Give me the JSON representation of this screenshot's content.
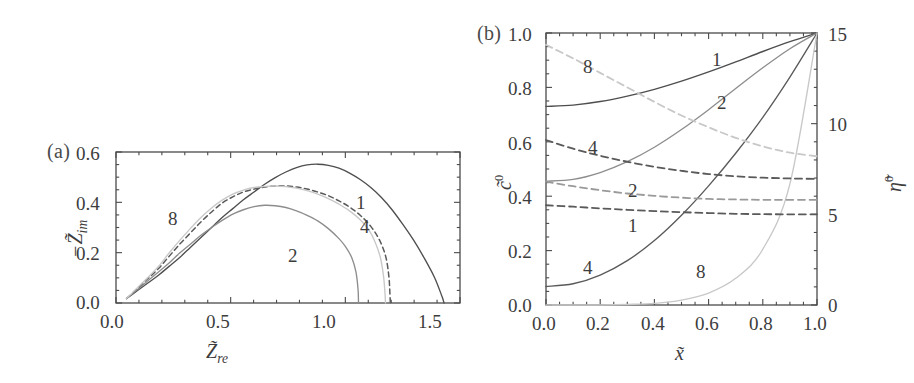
{
  "figure": {
    "background": "#ffffff",
    "panels": [
      "a",
      "b"
    ]
  },
  "panel_a": {
    "tag": "(a)",
    "xlabel": "Z̃",
    "xlabel_sub": "re",
    "ylabel_prefix": "−Z̃",
    "ylabel_sub": "im",
    "xticks": [
      "0.0",
      "0.5",
      "1.0",
      "1.5"
    ],
    "yticks": [
      "0.0",
      "0.2",
      "0.4",
      "0.6"
    ],
    "curve_labels": [
      "1",
      "2",
      "4",
      "8"
    ]
  },
  "panel_b": {
    "tag": "(b)",
    "xlabel": "x̃",
    "ylabel_left": "c̃",
    "ylabel_left_sup": "0",
    "ylabel_right": "η̃",
    "ylabel_right_sup": "0",
    "xticks": [
      "0.0",
      "0.2",
      "0.4",
      "0.6",
      "0.8",
      "1.0"
    ],
    "yticks_left": [
      "0.0",
      "0.2",
      "0.4",
      "0.6",
      "0.8",
      "1.0"
    ],
    "yticks_right": [
      "0",
      "5",
      "10",
      "15"
    ],
    "curve_labels_solid": [
      "1",
      "2",
      "4",
      "8"
    ],
    "curve_labels_dashed": [
      "1",
      "2",
      "4",
      "8"
    ]
  },
  "colors": {
    "axis": "#4a4a4a",
    "curve_1": "#4e4e4e",
    "curve_2": "#8d8d8d",
    "curve_4": "#5a5a5a",
    "curve_8": "#c8c8c8",
    "text": "#3d3d3d"
  },
  "chart_data": [
    {
      "type": "line",
      "id": "panel-a",
      "title": "(a)",
      "xlabel": "Z_re (tilde)",
      "ylabel": "-Z_im (tilde)",
      "xlim": [
        0.0,
        1.62
      ],
      "ylim": [
        0.0,
        0.68
      ],
      "xticks": [
        0.0,
        0.5,
        1.0,
        1.5
      ],
      "yticks": [
        0.0,
        0.2,
        0.4,
        0.6
      ],
      "grid": false,
      "legend": "inline-curve-labels",
      "series": [
        {
          "name": "1",
          "style": "solid",
          "color": "#4e4e4e",
          "points": [
            [
              0.05,
              0.02
            ],
            [
              0.1,
              0.055
            ],
            [
              0.15,
              0.09
            ],
            [
              0.2,
              0.125
            ],
            [
              0.25,
              0.165
            ],
            [
              0.3,
              0.205
            ],
            [
              0.35,
              0.25
            ],
            [
              0.4,
              0.295
            ],
            [
              0.45,
              0.34
            ],
            [
              0.5,
              0.385
            ],
            [
              0.55,
              0.425
            ],
            [
              0.6,
              0.465
            ],
            [
              0.65,
              0.5
            ],
            [
              0.7,
              0.535
            ],
            [
              0.75,
              0.565
            ],
            [
              0.8,
              0.59
            ],
            [
              0.85,
              0.61
            ],
            [
              0.9,
              0.622
            ],
            [
              0.95,
              0.625
            ],
            [
              1.0,
              0.62
            ],
            [
              1.05,
              0.607
            ],
            [
              1.1,
              0.585
            ],
            [
              1.15,
              0.556
            ],
            [
              1.2,
              0.52
            ],
            [
              1.25,
              0.475
            ],
            [
              1.3,
              0.42
            ],
            [
              1.35,
              0.355
            ],
            [
              1.4,
              0.285
            ],
            [
              1.45,
              0.205
            ],
            [
              1.5,
              0.115
            ],
            [
              1.535,
              0.03
            ],
            [
              1.545,
              0.0
            ]
          ]
        },
        {
          "name": "2",
          "style": "solid",
          "color": "#8d8d8d",
          "points": [
            [
              0.05,
              0.02
            ],
            [
              0.1,
              0.06
            ],
            [
              0.15,
              0.1
            ],
            [
              0.2,
              0.14
            ],
            [
              0.25,
              0.18
            ],
            [
              0.3,
              0.225
            ],
            [
              0.35,
              0.265
            ],
            [
              0.4,
              0.305
            ],
            [
              0.45,
              0.34
            ],
            [
              0.5,
              0.372
            ],
            [
              0.55,
              0.4
            ],
            [
              0.6,
              0.42
            ],
            [
              0.65,
              0.434
            ],
            [
              0.7,
              0.44
            ],
            [
              0.75,
              0.438
            ],
            [
              0.8,
              0.43
            ],
            [
              0.85,
              0.415
            ],
            [
              0.9,
              0.395
            ],
            [
              0.95,
              0.37
            ],
            [
              1.0,
              0.335
            ],
            [
              1.05,
              0.29
            ],
            [
              1.08,
              0.255
            ],
            [
              1.11,
              0.205
            ],
            [
              1.13,
              0.14
            ],
            [
              1.14,
              0.06
            ],
            [
              1.142,
              0.0
            ]
          ]
        },
        {
          "name": "4",
          "style": "dashed",
          "color": "#5a5a5a",
          "points": [
            [
              0.05,
              0.02
            ],
            [
              0.1,
              0.065
            ],
            [
              0.15,
              0.11
            ],
            [
              0.2,
              0.155
            ],
            [
              0.25,
              0.21
            ],
            [
              0.3,
              0.265
            ],
            [
              0.35,
              0.315
            ],
            [
              0.4,
              0.365
            ],
            [
              0.45,
              0.41
            ],
            [
              0.5,
              0.45
            ],
            [
              0.55,
              0.478
            ],
            [
              0.6,
              0.5
            ],
            [
              0.65,
              0.513
            ],
            [
              0.7,
              0.522
            ],
            [
              0.75,
              0.527
            ],
            [
              0.8,
              0.527
            ],
            [
              0.85,
              0.522
            ],
            [
              0.9,
              0.513
            ],
            [
              0.95,
              0.5
            ],
            [
              1.0,
              0.483
            ],
            [
              1.05,
              0.46
            ],
            [
              1.1,
              0.432
            ],
            [
              1.15,
              0.395
            ],
            [
              1.2,
              0.345
            ],
            [
              1.24,
              0.285
            ],
            [
              1.27,
              0.21
            ],
            [
              1.285,
              0.12
            ],
            [
              1.29,
              0.04
            ],
            [
              1.292,
              0.0
            ]
          ]
        },
        {
          "name": "8",
          "style": "solid",
          "color": "#c8c8c8",
          "points": [
            [
              0.05,
              0.02
            ],
            [
              0.1,
              0.068
            ],
            [
              0.15,
              0.115
            ],
            [
              0.2,
              0.165
            ],
            [
              0.25,
              0.225
            ],
            [
              0.3,
              0.282
            ],
            [
              0.35,
              0.335
            ],
            [
              0.4,
              0.385
            ],
            [
              0.45,
              0.428
            ],
            [
              0.5,
              0.463
            ],
            [
              0.55,
              0.49
            ],
            [
              0.6,
              0.508
            ],
            [
              0.65,
              0.52
            ],
            [
              0.7,
              0.525
            ],
            [
              0.75,
              0.527
            ],
            [
              0.8,
              0.524
            ],
            [
              0.85,
              0.517
            ],
            [
              0.9,
              0.506
            ],
            [
              0.95,
              0.49
            ],
            [
              1.0,
              0.47
            ],
            [
              1.05,
              0.445
            ],
            [
              1.1,
              0.415
            ],
            [
              1.15,
              0.375
            ],
            [
              1.19,
              0.33
            ],
            [
              1.22,
              0.275
            ],
            [
              1.245,
              0.205
            ],
            [
              1.26,
              0.12
            ],
            [
              1.267,
              0.04
            ],
            [
              1.269,
              0.0
            ]
          ]
        }
      ]
    },
    {
      "type": "line",
      "id": "panel-b",
      "title": "(b)",
      "xlabel": "x (tilde)",
      "ylabel": "c^0 (tilde)",
      "ylabel_secondary": "eta^0 (tilde)",
      "xlim": [
        0.0,
        1.0
      ],
      "ylim": [
        0.0,
        1.0
      ],
      "ylim_secondary": [
        0,
        15
      ],
      "xticks": [
        0.0,
        0.2,
        0.4,
        0.6,
        0.8,
        1.0
      ],
      "yticks": [
        0.0,
        0.2,
        0.4,
        0.6,
        0.8,
        1.0
      ],
      "yticks_secondary": [
        0,
        5,
        10,
        15
      ],
      "grid": false,
      "legend": "inline-curve-labels",
      "series": [
        {
          "name": "1",
          "axis": "left",
          "style": "solid",
          "color": "#4e4e4e",
          "points": [
            [
              0.0,
              0.73
            ],
            [
              0.1,
              0.735
            ],
            [
              0.2,
              0.748
            ],
            [
              0.3,
              0.768
            ],
            [
              0.4,
              0.793
            ],
            [
              0.5,
              0.823
            ],
            [
              0.6,
              0.857
            ],
            [
              0.7,
              0.894
            ],
            [
              0.8,
              0.932
            ],
            [
              0.9,
              0.968
            ],
            [
              1.0,
              1.0
            ]
          ]
        },
        {
          "name": "2",
          "axis": "left",
          "style": "solid",
          "color": "#8d8d8d",
          "points": [
            [
              0.0,
              0.455
            ],
            [
              0.1,
              0.462
            ],
            [
              0.2,
              0.487
            ],
            [
              0.3,
              0.527
            ],
            [
              0.4,
              0.58
            ],
            [
              0.5,
              0.645
            ],
            [
              0.6,
              0.718
            ],
            [
              0.7,
              0.796
            ],
            [
              0.8,
              0.872
            ],
            [
              0.9,
              0.942
            ],
            [
              1.0,
              1.0
            ]
          ]
        },
        {
          "name": "4",
          "axis": "left",
          "style": "solid",
          "color": "#5a5a5a",
          "points": [
            [
              0.0,
              0.068
            ],
            [
              0.1,
              0.078
            ],
            [
              0.2,
              0.11
            ],
            [
              0.3,
              0.163
            ],
            [
              0.4,
              0.237
            ],
            [
              0.5,
              0.33
            ],
            [
              0.6,
              0.438
            ],
            [
              0.7,
              0.558
            ],
            [
              0.8,
              0.69
            ],
            [
              0.9,
              0.838
            ],
            [
              1.0,
              1.0
            ]
          ]
        },
        {
          "name": "8",
          "axis": "left",
          "style": "solid",
          "color": "#c8c8c8",
          "points": [
            [
              0.0,
              0.0
            ],
            [
              0.1,
              0.0
            ],
            [
              0.2,
              0.0
            ],
            [
              0.3,
              0.002
            ],
            [
              0.4,
              0.006
            ],
            [
              0.5,
              0.018
            ],
            [
              0.6,
              0.044
            ],
            [
              0.7,
              0.098
            ],
            [
              0.8,
              0.205
            ],
            [
              0.9,
              0.445
            ],
            [
              1.0,
              1.0
            ]
          ]
        },
        {
          "name": "1",
          "axis": "right",
          "style": "dashed",
          "color": "#5a5a5a",
          "points": [
            [
              0.0,
              5.5
            ],
            [
              0.1,
              5.42
            ],
            [
              0.2,
              5.33
            ],
            [
              0.3,
              5.25
            ],
            [
              0.4,
              5.18
            ],
            [
              0.5,
              5.12
            ],
            [
              0.6,
              5.07
            ],
            [
              0.7,
              5.03
            ],
            [
              0.8,
              5.01
            ],
            [
              0.9,
              5.0
            ],
            [
              1.0,
              5.0
            ]
          ]
        },
        {
          "name": "2",
          "axis": "right",
          "style": "dashed",
          "color": "#9a9a9a",
          "points": [
            [
              0.0,
              6.8
            ],
            [
              0.1,
              6.55
            ],
            [
              0.2,
              6.33
            ],
            [
              0.3,
              6.15
            ],
            [
              0.4,
              6.02
            ],
            [
              0.5,
              5.92
            ],
            [
              0.6,
              5.85
            ],
            [
              0.7,
              5.82
            ],
            [
              0.8,
              5.8
            ],
            [
              0.9,
              5.8
            ],
            [
              1.0,
              5.8
            ]
          ]
        },
        {
          "name": "4",
          "axis": "right",
          "style": "dashed",
          "color": "#5a5a5a",
          "points": [
            [
              0.0,
              9.1
            ],
            [
              0.1,
              8.62
            ],
            [
              0.2,
              8.23
            ],
            [
              0.3,
              7.9
            ],
            [
              0.4,
              7.62
            ],
            [
              0.5,
              7.4
            ],
            [
              0.6,
              7.22
            ],
            [
              0.7,
              7.1
            ],
            [
              0.8,
              7.02
            ],
            [
              0.9,
              6.98
            ],
            [
              1.0,
              6.95
            ]
          ]
        },
        {
          "name": "8",
          "axis": "right",
          "style": "dashed",
          "color": "#c8c8c8",
          "points": [
            [
              0.0,
              14.35
            ],
            [
              0.1,
              13.6
            ],
            [
              0.2,
              12.8
            ],
            [
              0.3,
              12.0
            ],
            [
              0.4,
              11.2
            ],
            [
              0.5,
              10.45
            ],
            [
              0.6,
              9.8
            ],
            [
              0.7,
              9.22
            ],
            [
              0.8,
              8.75
            ],
            [
              0.9,
              8.4
            ],
            [
              1.0,
              8.2
            ]
          ]
        }
      ]
    }
  ]
}
